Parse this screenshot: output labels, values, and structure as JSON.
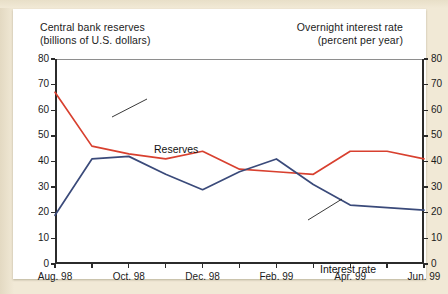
{
  "titles": {
    "left_line1": "Central bank reserves",
    "left_line2": "(billions of U.S. dollars)",
    "right_line1": "Overnight interest rate",
    "right_line2": "(percent per year)"
  },
  "colors": {
    "reserves": "#d8402f",
    "interest_rate": "#3a4a7a",
    "axis": "#2b2b2b",
    "card_background": "#ffffff",
    "page_background": "#f1e9d6"
  },
  "annotations": [
    {
      "name": "reserves",
      "label": "Reserves"
    },
    {
      "name": "interest-rate",
      "label": "Interest rate"
    }
  ],
  "chart_data": {
    "type": "line",
    "title": "",
    "xlabel": "",
    "ylabel": "Central bank reserves (billions of U.S. dollars)",
    "ylabel_right": "Overnight interest rate (percent per year)",
    "grid": false,
    "legend": "inline-annotations",
    "ylim": [
      0,
      80
    ],
    "yticks": [
      0,
      10,
      20,
      30,
      40,
      50,
      60,
      70,
      80
    ],
    "yticks_right": [
      0,
      10,
      20,
      30,
      40,
      50,
      60,
      70,
      80
    ],
    "x": [
      "Aug. 98",
      "Sep. 98",
      "Oct. 98",
      "Nov. 98",
      "Dec. 98",
      "Jan. 99",
      "Feb. 99",
      "Mar. 99",
      "Apr. 99",
      "May 99",
      "Jun. 99"
    ],
    "xtick_labels": [
      "Aug. 98",
      "Oct. 98",
      "Dec. 98",
      "Feb. 99",
      "Apr. 99",
      "Jun. 99"
    ],
    "xtick_indices": [
      0,
      2,
      4,
      6,
      8,
      10
    ],
    "series": [
      {
        "name": "Reserves",
        "axis": "left",
        "color": "#d8402f",
        "values": [
          67,
          46,
          43,
          41,
          44,
          37,
          36,
          35,
          44,
          44,
          41
        ]
      },
      {
        "name": "Interest rate",
        "axis": "right",
        "color": "#3a4a7a",
        "values": [
          19,
          41,
          42,
          35,
          29,
          36,
          41,
          31,
          23,
          22,
          21
        ]
      }
    ]
  }
}
